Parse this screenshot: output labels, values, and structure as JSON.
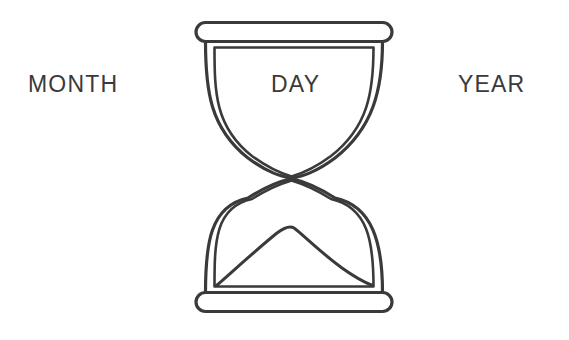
{
  "page": {
    "background_color": "#ffffff",
    "ink_color": "#3a3a3a",
    "width": 569,
    "height": 340
  },
  "labels": {
    "left": "MONTH",
    "center": "DAY",
    "right": "YEAR"
  },
  "figure": {
    "name": "hourglass",
    "style": "line-art outline",
    "stroke_color": "#3a3a3a",
    "stroke_width": 3,
    "fill": "none",
    "parts": [
      "top-cap",
      "upper-bulb",
      "waist",
      "lower-bulb",
      "sand-mound",
      "bottom-cap"
    ]
  },
  "diagram_data": {
    "type": "diagram",
    "title": "",
    "elements": [
      {
        "label": "MONTH",
        "position": "left"
      },
      {
        "label": "DAY",
        "position": "center"
      },
      {
        "label": "YEAR",
        "position": "right"
      }
    ],
    "icon": "hourglass"
  }
}
